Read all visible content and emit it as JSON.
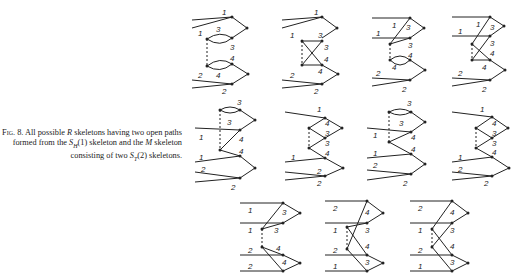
{
  "figure": {
    "number": "8",
    "caption_prefix": "Fig. 8.",
    "caption_line1": "All possible R skeletons having two",
    "caption_line2": "open paths formed from the S_H(1) skeleton and",
    "caption_line3": "the M skeleton consisting of two S_T(2) skeletons.",
    "caption_full": "Fig. 8. All possible R skeletons having two open paths formed from the S_H(1) skeleton and the M skeleton consisting of two S_T(2) skeletons."
  },
  "diagrams": [
    {
      "id": "r1c1",
      "row": 1,
      "col": 1,
      "labels": [
        "1",
        "1",
        "3",
        "3",
        "4",
        "4",
        "2",
        "2"
      ]
    },
    {
      "id": "r1c2",
      "row": 1,
      "col": 2,
      "labels": [
        "1",
        "1",
        "3",
        "3",
        "4",
        "4",
        "2",
        "2"
      ]
    },
    {
      "id": "r1c3",
      "row": 1,
      "col": 3,
      "labels": [
        "1",
        "1",
        "3",
        "3",
        "4",
        "4",
        "2",
        "2"
      ]
    },
    {
      "id": "r1c4",
      "row": 1,
      "col": 4,
      "labels": [
        "1",
        "1",
        "3",
        "3",
        "4",
        "4",
        "2",
        "2"
      ]
    },
    {
      "id": "r2c1",
      "row": 2,
      "col": 1,
      "labels": [
        "3",
        "3",
        "1",
        "4",
        "1",
        "4",
        "2",
        "2"
      ]
    },
    {
      "id": "r2c2",
      "row": 2,
      "col": 2,
      "labels": [
        "1",
        "4",
        "3",
        "3",
        "4",
        "1",
        "2",
        "2"
      ]
    },
    {
      "id": "r2c3",
      "row": 2,
      "col": 3,
      "labels": [
        "3",
        "3",
        "1",
        "4",
        "1",
        "4",
        "2",
        "2"
      ]
    },
    {
      "id": "r2c4",
      "row": 2,
      "col": 4,
      "labels": [
        "1",
        "4",
        "3",
        "3",
        "4",
        "1",
        "2",
        "2"
      ]
    },
    {
      "id": "r3c1",
      "row": 3,
      "col": 1,
      "labels": [
        "1",
        "3",
        "1",
        "3",
        "4",
        "2",
        "4",
        "2"
      ]
    },
    {
      "id": "r3c2",
      "row": 3,
      "col": 2,
      "labels": [
        "2",
        "4",
        "1",
        "3",
        "4",
        "2",
        "3",
        "1"
      ]
    },
    {
      "id": "r3c3",
      "row": 3,
      "col": 3,
      "labels": [
        "2",
        "4",
        "1",
        "3",
        "4",
        "2",
        "3",
        "1"
      ]
    }
  ]
}
